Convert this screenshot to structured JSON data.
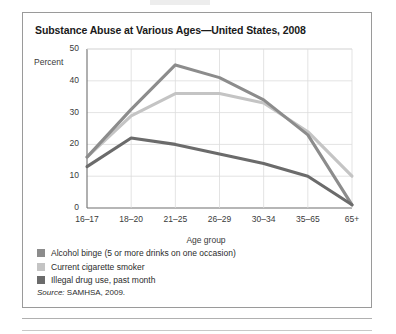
{
  "figure": {
    "title": "Substance Abuse at Various Ages—United States, 2008",
    "percent_label": "Percent",
    "axis_title": "Age group",
    "source": "Source:",
    "source_text": " SAMHSA, 2009."
  },
  "colors": {
    "alcohol": "#8c8c8c",
    "cigarette": "#c4c4c4",
    "drug": "#6b6b6b",
    "grid": "#dcdcdc",
    "axis": "#6f6f6f",
    "border": "#9a9a9a"
  },
  "chart_data": {
    "type": "line",
    "title": "Substance Abuse at Various Ages—United States, 2008",
    "xlabel": "Age group",
    "ylabel": "Percent",
    "ylim": [
      0,
      50
    ],
    "yticks": [
      0,
      10,
      20,
      30,
      40,
      50
    ],
    "grid": true,
    "legend_position": "below",
    "categories": [
      "16–17",
      "18–20",
      "21–25",
      "26–29",
      "30–34",
      "35–65",
      "65+"
    ],
    "series": [
      {
        "name": "Alcohol binge (5 or more drinks on one occasion)",
        "color": "#8c8c8c",
        "values": [
          16,
          31,
          45,
          41,
          34,
          23,
          1
        ]
      },
      {
        "name": "Current cigarette smoker",
        "color": "#c4c4c4",
        "values": [
          16,
          29,
          36,
          36,
          33,
          24,
          10
        ]
      },
      {
        "name": "Illegal drug use, past month",
        "color": "#6b6b6b",
        "values": [
          13,
          22,
          20,
          17,
          14,
          10,
          1
        ]
      }
    ]
  }
}
